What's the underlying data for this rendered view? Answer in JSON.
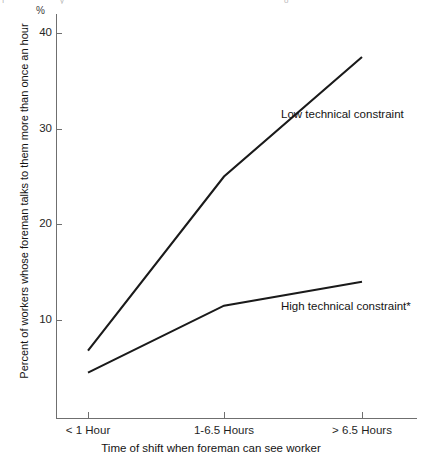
{
  "chart_data": {
    "type": "line",
    "title": "",
    "categories": [
      "< 1 Hour",
      "1-6.5 Hours",
      "> 6.5 Hours"
    ],
    "series": [
      {
        "name": "Low technical constraint",
        "values": [
          6.8,
          25.0,
          37.5
        ]
      },
      {
        "name": "High technical constraint*",
        "values": [
          4.5,
          11.5,
          14.0
        ]
      }
    ],
    "xlabel": "Time of shift when foreman can see worker",
    "ylabel": "Percent of workers whose foreman talks to them more than once an hour",
    "yunit": "%",
    "yticks": [
      10,
      20,
      30,
      40
    ],
    "ylim": [
      0,
      43
    ],
    "grid": false,
    "legend_position": "inline-annotation"
  },
  "axes": {
    "y_unit_symbol": "%",
    "y_tick_labels": [
      "40",
      "30",
      "20",
      "10"
    ],
    "x_tick_labels": [
      "< 1 Hour",
      "1-6.5 Hours",
      "> 6.5 Hours"
    ],
    "x_title": "Time of shift when foreman can see worker",
    "y_title": "Percent of workers whose foreman talks to them more than once an hour"
  },
  "annotations": {
    "low_label": "Low technical constraint",
    "high_label": "High technical constraint*"
  },
  "colors": {
    "line": "#1a1a1a",
    "axis": "#6f6f6f",
    "text": "#141414",
    "background": "#ffffff"
  }
}
